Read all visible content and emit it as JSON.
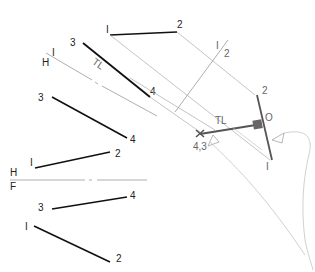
{
  "diagram": {
    "colors": {
      "object_line": "#111111",
      "construction": "#aaaaaa",
      "fold_line": "#999999",
      "final_view": "#555555",
      "right_angle_fill": "#666666"
    },
    "fold_lines": {
      "hf": {
        "top_label": "H",
        "bottom_label": "F"
      },
      "h1": {
        "top_label": "H",
        "bottom_label": "I"
      },
      "v12": {
        "top_label": "I",
        "bottom_label": "2"
      }
    },
    "front_view": {
      "line_12": {
        "p1": "I",
        "p2": "2"
      },
      "line_34": {
        "p3": "3",
        "p4": "4"
      }
    },
    "top_view": {
      "line_12": {
        "p1": "I",
        "p2": "2"
      },
      "line_34": {
        "p3": "3",
        "p4": "4"
      }
    },
    "aux1_view": {
      "line_12": {
        "p1": "I",
        "p2": "2"
      },
      "line_34": {
        "p3": "3",
        "p4": "4"
      },
      "tl_label": "TL"
    },
    "aux2_view": {
      "line_12": {
        "p1": "I",
        "p2": "2"
      },
      "point_view_label": "4,3",
      "intersection_label": "O",
      "tl_label": "TL"
    }
  }
}
